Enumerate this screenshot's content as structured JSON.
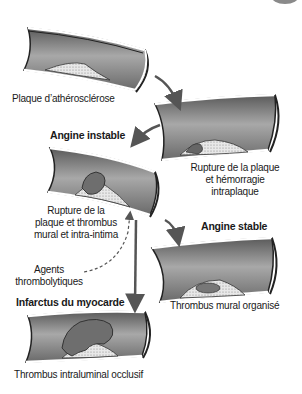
{
  "diagram": {
    "type": "process-flow",
    "stages": [
      {
        "id": "plaque",
        "caption": "Plaque d’athérosclérose"
      },
      {
        "id": "rupture",
        "caption_lines": [
          "Rupture de la plaque",
          "et hémorragie",
          "intraplaque"
        ]
      },
      {
        "id": "angine-instable",
        "title": "Angine instable",
        "caption_lines": [
          "Rupture de la",
          "plaque et thrombus",
          "mural et intra-intima"
        ]
      },
      {
        "id": "angine-stable",
        "title": "Angine stable",
        "caption": "Thrombus mural organisé"
      },
      {
        "id": "infarctus",
        "title": "Infarctus du myocarde",
        "caption": "Thrombus intraluminal occlusif"
      }
    ],
    "intervention": {
      "caption_lines": [
        "Agents",
        "thrombolytiques"
      ]
    },
    "colors": {
      "vessel_wall": "#7a7a7a",
      "vessel_lumen": "#9a9a9a",
      "vessel_edge": "#222222",
      "arrow": "#555555",
      "thrombus": "#6e6e6e"
    }
  }
}
